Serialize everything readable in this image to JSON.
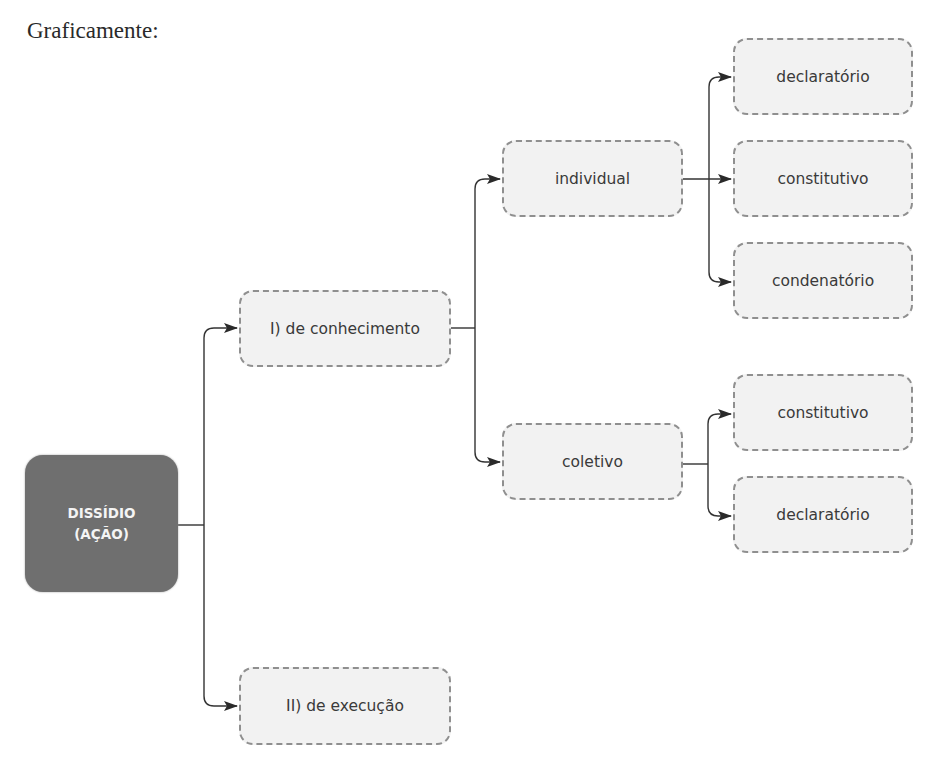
{
  "heading": "Graficamente:",
  "diagram": {
    "root": {
      "line1": "DISSÍDIO",
      "line2": "(AÇÃO)",
      "color": "#6f6f6f"
    },
    "level1": [
      {
        "label": "I) de conhecimento"
      },
      {
        "label": "II) de execução"
      }
    ],
    "level2": [
      {
        "label": "individual",
        "parent": "I) de conhecimento"
      },
      {
        "label": "coletivo",
        "parent": "I) de conhecimento"
      }
    ],
    "level3_individual": [
      {
        "label": "declaratório"
      },
      {
        "label": "constitutivo"
      },
      {
        "label": "condenatório"
      }
    ],
    "level3_coletivo": [
      {
        "label": "constitutivo"
      },
      {
        "label": "declaratório"
      }
    ],
    "colors": {
      "node_fill": "#f2f2f2",
      "node_border": "#8f8f8f",
      "connector": "#333333",
      "text": "#3a3a3a"
    }
  }
}
